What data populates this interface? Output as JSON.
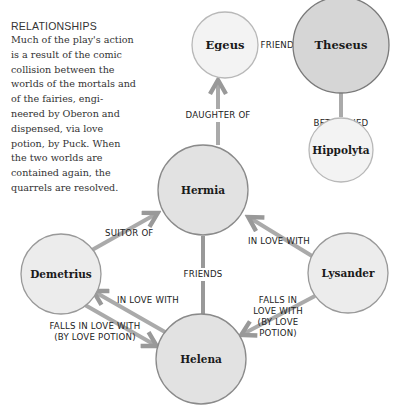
{
  "intro": {
    "heading": "RELATIONSHIPS",
    "body": "Much of the play's action is a result of the comic collision between the worlds of the mortals and of the fairies, engi-neered by Oberon and dispensed, via love potion, by Puck. When the two worlds are contained again, the quarrels are resolved."
  },
  "nodes": {
    "egeus": "Egeus",
    "theseus": "Theseus",
    "hippolyta": "Hippolyta",
    "hermia": "Hermia",
    "demetrius": "Demetrius",
    "lysander": "Lysander",
    "helena": "Helena"
  },
  "edges": {
    "egeus_theseus": "FRIENDS",
    "theseus_hippolyta": "BETROTHED",
    "hermia_egeus": "DAUGHTER OF",
    "demetrius_hermia": "SUITOR OF",
    "lysander_hermia": "IN LOVE WITH",
    "hermia_helena": "FRIENDS",
    "helena_demetrius": "IN LOVE WITH",
    "demetrius_helena_1": "FALLS IN LOVE WITH",
    "demetrius_helena_2": "(BY LOVE POTION)",
    "lysander_helena_1": "FALLS IN",
    "lysander_helena_2": "LOVE WITH",
    "lysander_helena_3": "(BY LOVE",
    "lysander_helena_4": "POTION)"
  },
  "colors": {
    "light_node": "#f1f1f1",
    "dark_node": "#d4d4d4",
    "mid_node": "#e4e4e4",
    "connector": "#9a9a9a"
  }
}
